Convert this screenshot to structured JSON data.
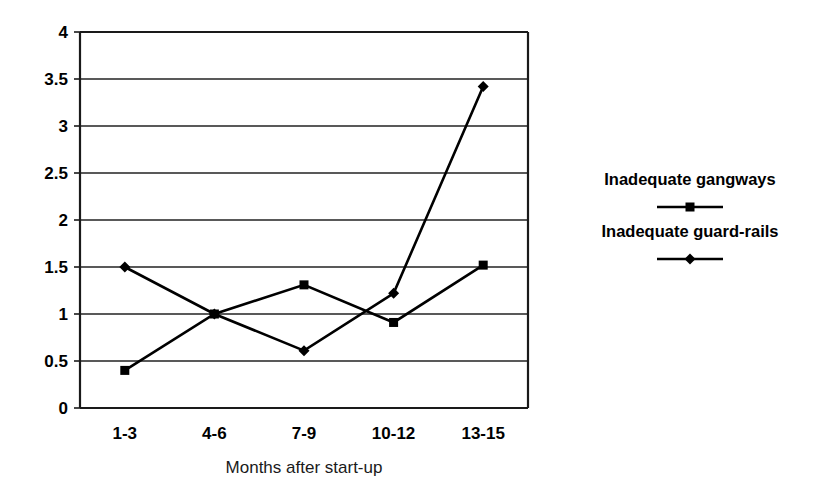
{
  "chart_data": {
    "type": "line",
    "title": "",
    "xlabel": "Months after start-up",
    "ylabel": "",
    "categories": [
      "1-3",
      "4-6",
      "7-9",
      "10-12",
      "13-15"
    ],
    "yticks": [
      "0",
      "0.5",
      "1",
      "1.5",
      "2",
      "2.5",
      "3",
      "3.5",
      "4"
    ],
    "ytick_values": [
      0,
      0.5,
      1,
      1.5,
      2,
      2.5,
      3,
      3.5,
      4
    ],
    "ylim": [
      0,
      4
    ],
    "grid": "horizontal",
    "legend_position": "right",
    "series": [
      {
        "name": "Inadequate gangways",
        "marker": "square",
        "color": "#000000",
        "values": [
          0.4,
          1.0,
          1.31,
          0.91,
          1.52
        ]
      },
      {
        "name": "Inadequate guard-rails",
        "marker": "diamond",
        "color": "#000000",
        "values": [
          1.5,
          1.0,
          0.61,
          1.22,
          3.42
        ]
      }
    ]
  },
  "axis": {
    "x_title": "Months after start-up"
  },
  "legend": {
    "entries": [
      {
        "label": "Inadequate gangways",
        "marker": "square-marker-icon"
      },
      {
        "label": "Inadequate guard-rails",
        "marker": "diamond-marker-icon"
      }
    ]
  }
}
